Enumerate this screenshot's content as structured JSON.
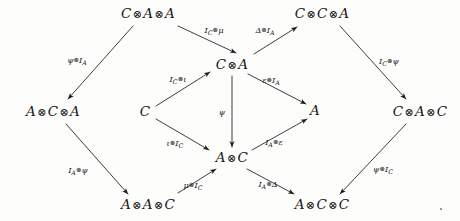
{
  "diagram": {
    "kind": "commutative-diagram",
    "background_color": "#fdfdfc",
    "ink_color": "#141414",
    "width": 460,
    "height": 221,
    "nodes": [
      {
        "id": "caa",
        "label": "C ⊗ A ⊗ A",
        "parts": [
          "C",
          "A",
          "A"
        ],
        "x": 148,
        "y": 14
      },
      {
        "id": "cca",
        "label": "C ⊗ C ⊗ A",
        "parts": [
          "C",
          "C",
          "A"
        ],
        "x": 322,
        "y": 14
      },
      {
        "id": "aca",
        "label": "A ⊗ C ⊗ A",
        "parts": [
          "A",
          "C",
          "A"
        ],
        "x": 53,
        "y": 112
      },
      {
        "id": "ca",
        "label": "C ⊗ A",
        "parts": [
          "C",
          "A"
        ],
        "x": 232,
        "y": 65
      },
      {
        "id": "c",
        "label": "C",
        "parts": [
          "C"
        ],
        "x": 145,
        "y": 112
      },
      {
        "id": "a",
        "label": "A",
        "parts": [
          "A"
        ],
        "x": 315,
        "y": 111
      },
      {
        "id": "cac",
        "label": "C ⊗ A ⊗ C",
        "parts": [
          "C",
          "A",
          "C"
        ],
        "x": 420,
        "y": 112
      },
      {
        "id": "ac",
        "label": "A ⊗ C",
        "parts": [
          "A",
          "C"
        ],
        "x": 232,
        "y": 158
      },
      {
        "id": "aac",
        "label": "A ⊗ A ⊗ C",
        "parts": [
          "A",
          "A",
          "C"
        ],
        "x": 148,
        "y": 205
      },
      {
        "id": "acc",
        "label": "A ⊗ C ⊗ C",
        "parts": [
          "A",
          "C",
          "C"
        ],
        "x": 322,
        "y": 205
      }
    ],
    "edges": [
      {
        "id": "e-psi-ia",
        "from": "caa",
        "to": "aca",
        "label_main": "ψ",
        "label_op": "⊗",
        "label_tail": "I",
        "label_sub": "A",
        "label_text": "ψ⊗I_A",
        "x1": 133,
        "y1": 26,
        "x2": 68,
        "y2": 99,
        "lx": 77,
        "ly": 61
      },
      {
        "id": "e-ic-mu",
        "from": "caa",
        "to": "ca",
        "label_main": "I",
        "label_sub": "C",
        "label_op": "⊗",
        "label_tail": "μ",
        "label_text": "I_C⊗μ",
        "x1": 178,
        "y1": 26,
        "x2": 236,
        "y2": 53,
        "lx": 214,
        "ly": 31
      },
      {
        "id": "e-delta-ia",
        "from": "ca",
        "to": "cca",
        "label_main": "Δ",
        "label_op": "⊗",
        "label_tail": "I",
        "label_sub": "A",
        "label_text": "Δ⊗I_A",
        "x1": 254,
        "y1": 54,
        "x2": 297,
        "y2": 27,
        "lx": 265,
        "ly": 31
      },
      {
        "id": "e-ic-psi",
        "from": "cca",
        "to": "cac",
        "label_main": "I",
        "label_sub": "C",
        "label_op": "⊗",
        "label_tail": "ψ",
        "label_text": "I_C⊗ψ",
        "x1": 340,
        "y1": 26,
        "x2": 406,
        "y2": 99,
        "lx": 389,
        "ly": 62
      },
      {
        "id": "e-ic-iota",
        "from": "c",
        "to": "ca",
        "label_main": "I",
        "label_sub": "C",
        "label_op": "⊗",
        "label_tail": "ι",
        "label_text": "I_C⊗ι",
        "x1": 156,
        "y1": 106,
        "x2": 210,
        "y2": 72,
        "lx": 178,
        "ly": 80
      },
      {
        "id": "e-eps-ia",
        "from": "ca",
        "to": "a",
        "label_main": "ε",
        "label_op": "⊗",
        "label_tail": "I",
        "label_sub": "A",
        "label_text": "ε⊗I_A",
        "x1": 248,
        "y1": 74,
        "x2": 306,
        "y2": 104,
        "lx": 271,
        "ly": 81
      },
      {
        "id": "e-psi",
        "from": "ca",
        "to": "ac",
        "label_main": "ψ",
        "label_op": "",
        "label_tail": "",
        "label_sub": "",
        "label_text": "ψ",
        "x1": 232,
        "y1": 76,
        "x2": 232,
        "y2": 147,
        "lx": 222,
        "ly": 112
      },
      {
        "id": "e-iota-ic",
        "from": "c",
        "to": "ac",
        "label_main": "ι",
        "label_op": "⊗",
        "label_tail": "I",
        "label_sub": "C",
        "label_text": "ι⊗I_C",
        "x1": 156,
        "y1": 119,
        "x2": 209,
        "y2": 150,
        "lx": 175,
        "ly": 144
      },
      {
        "id": "e-ia-eps",
        "from": "ac",
        "to": "a",
        "label_main": "I",
        "label_sub": "A",
        "label_op": "⊗",
        "label_tail": "ε",
        "label_text": "I_A⊗ε",
        "x1": 252,
        "y1": 150,
        "x2": 307,
        "y2": 119,
        "lx": 274,
        "ly": 143
      },
      {
        "id": "e-ia-psi",
        "from": "aca",
        "to": "aac",
        "label_main": "I",
        "label_sub": "A",
        "label_op": "⊗",
        "label_tail": "ψ",
        "label_text": "I_A⊗ψ",
        "x1": 66,
        "y1": 124,
        "x2": 128,
        "y2": 194,
        "lx": 78,
        "ly": 171
      },
      {
        "id": "e-mu-ic",
        "from": "aac",
        "to": "ac",
        "label_main": "μ",
        "label_op": "⊗",
        "label_tail": "I",
        "label_sub": "C",
        "label_text": "μ⊗I_C",
        "x1": 178,
        "y1": 193,
        "x2": 216,
        "y2": 169,
        "lx": 193,
        "ly": 186
      },
      {
        "id": "e-ia-delta",
        "from": "ac",
        "to": "acc",
        "label_main": "I",
        "label_sub": "A",
        "label_op": "⊗",
        "label_tail": "Δ",
        "label_text": "I_A⊗Δ",
        "x1": 247,
        "y1": 169,
        "x2": 294,
        "y2": 194,
        "lx": 268,
        "ly": 185
      },
      {
        "id": "e-psi-ic",
        "from": "cac",
        "to": "acc",
        "label_main": "ψ",
        "label_op": "⊗",
        "label_tail": "I",
        "label_sub": "C",
        "label_text": "ψ⊗I_C",
        "x1": 406,
        "y1": 124,
        "x2": 340,
        "y2": 194,
        "lx": 383,
        "ly": 170
      }
    ],
    "stray_mark": {
      "id": "stray-dot",
      "x": 441,
      "y": 209
    }
  }
}
